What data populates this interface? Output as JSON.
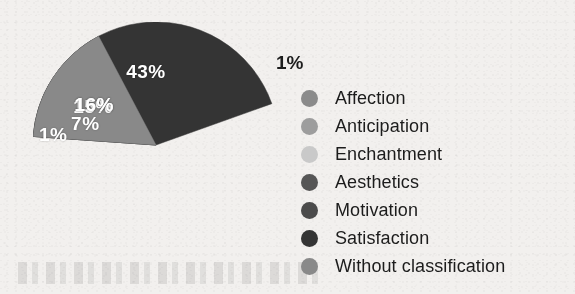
{
  "chart_data": {
    "type": "pie",
    "title": "",
    "subtitle": "",
    "xlabel": "",
    "ylabel": "",
    "grid": false,
    "legend_position": "right",
    "units": "percent",
    "categories": [
      "Affection",
      "Anticipation",
      "Enchantment",
      "Aesthetics",
      "Motivation",
      "Satisfaction",
      "Without classification"
    ],
    "values": [
      15,
      1,
      1,
      7,
      16,
      43,
      16
    ],
    "data_labels": [
      "15%",
      "1%",
      "1%",
      "7%",
      "16%",
      "43%",
      "16%"
    ],
    "colors": [
      "#8b8b8b",
      "#9a9a9a",
      "#c9c9c9",
      "#555555",
      "#4d4d4d",
      "#333333",
      "#8a8a8a"
    ],
    "slices": [
      {
        "label": "Affection",
        "value": 15,
        "data_label": "15%",
        "color": "#8b8b8b",
        "label_color": "#ffffff",
        "label_inside": true
      },
      {
        "label": "Anticipation",
        "value": 1,
        "data_label": "1%",
        "color": "#9d9d9d",
        "label_color": "#ffffff",
        "label_inside": true
      },
      {
        "label": "Enchantment",
        "value": 1,
        "data_label": "1%",
        "color": "#d2d2d2",
        "label_color": "#1d1d1d",
        "label_inside": false
      },
      {
        "label": "Aesthetics",
        "value": 7,
        "data_label": "7%",
        "color": "#565656",
        "label_color": "#ffffff",
        "label_inside": true
      },
      {
        "label": "Motivation",
        "value": 16,
        "data_label": "16%",
        "color": "#4b4b4b",
        "label_color": "#ffffff",
        "label_inside": true
      },
      {
        "label": "Satisfaction",
        "value": 43,
        "data_label": "43%",
        "color": "#343434",
        "label_color": "#ffffff",
        "label_inside": true
      },
      {
        "label": "Without classification",
        "value": 16,
        "data_label": "16%",
        "color": "#898989",
        "label_color": "#ffffff",
        "label_inside": true
      }
    ]
  },
  "chart": {
    "labels": {
      "affection": "15%",
      "anticipation": "1%",
      "enchantment": "1%",
      "aesthetics": "7%",
      "motivation": "16%",
      "satisfaction": "43%",
      "without_classification": "16%"
    }
  },
  "legend": {
    "items": [
      {
        "label": "Affection",
        "color": "#8b8b8b"
      },
      {
        "label": "Anticipation",
        "color": "#9d9d9d"
      },
      {
        "label": "Enchantment",
        "color": "#c9c9c9"
      },
      {
        "label": "Aesthetics",
        "color": "#565656"
      },
      {
        "label": "Motivation",
        "color": "#4b4b4b"
      },
      {
        "label": "Satisfaction",
        "color": "#343434"
      },
      {
        "label": "Without classification",
        "color": "#898989"
      }
    ]
  }
}
